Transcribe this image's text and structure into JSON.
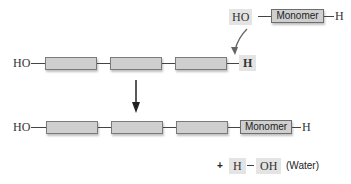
{
  "diagram": {
    "type": "dehydration-synthesis",
    "incoming_monomer": {
      "left_group": "HO",
      "unit_label": "Monomer",
      "right_group": "H"
    },
    "initial_polymer": {
      "left_group": "HO",
      "units": 3,
      "right_group": "H"
    },
    "product_polymer": {
      "left_group": "HO",
      "units": 3,
      "added_unit_label": "Monomer",
      "right_group": "H"
    },
    "byproduct": {
      "plus": "+",
      "left": "H",
      "right": "OH",
      "label": "(Water)"
    }
  },
  "colors": {
    "unit_fill": "#cfcfcf",
    "unit_border": "#7a7a7a",
    "highlight": "#e4e4e4",
    "line": "#444444"
  }
}
